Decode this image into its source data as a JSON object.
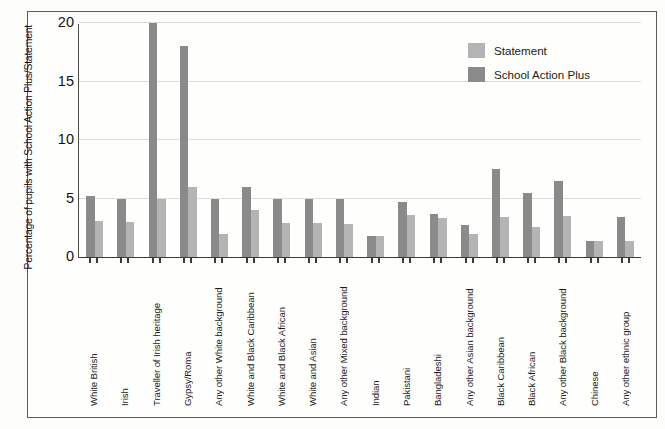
{
  "chart_data": {
    "type": "bar",
    "title": "",
    "xlabel": "",
    "ylabel": "Percentage of pupils with School Action Plus/Statement",
    "ylim": [
      0,
      20
    ],
    "yticks": [
      0,
      5,
      10,
      15,
      20
    ],
    "grid": true,
    "legend_position": "top-right",
    "categories": [
      "White British",
      "Irish",
      "Traveller of Irish heritage",
      "Gypsy/Roma",
      "Any other White background",
      "White and Black Caribbean",
      "White and Black African",
      "White and Asian",
      "Any other Mixed background",
      "Indian",
      "Pakistani",
      "Bangladeshi",
      "Any other Asian background",
      "Black Caribbean",
      "Black African",
      "Any other Black background",
      "Chinese",
      "Any other ethnic group"
    ],
    "series": [
      {
        "name": "School Action Plus",
        "color": "#8a8a8a",
        "values": [
          5.2,
          5.0,
          20.0,
          18.0,
          5.0,
          6.0,
          5.0,
          5.0,
          5.0,
          1.8,
          4.7,
          3.7,
          2.7,
          7.5,
          5.5,
          6.5,
          1.4,
          3.4
        ]
      },
      {
        "name": "Statement",
        "color": "#b4b4b4",
        "values": [
          3.1,
          3.0,
          5.0,
          6.0,
          2.0,
          4.0,
          2.9,
          2.9,
          2.8,
          1.8,
          3.6,
          3.3,
          2.0,
          3.4,
          2.6,
          3.5,
          1.4,
          1.4
        ]
      }
    ]
  },
  "legend": {
    "items": [
      {
        "label": "Statement",
        "key": "stmt"
      },
      {
        "label": "School Action Plus",
        "key": "sap"
      }
    ]
  },
  "axis": {
    "y_tick_labels": [
      "20",
      "15",
      "10",
      "5",
      "0"
    ]
  }
}
